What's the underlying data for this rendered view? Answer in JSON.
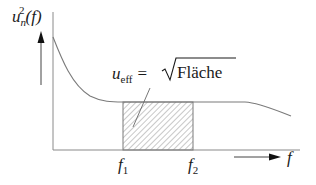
{
  "diagram": {
    "type": "noise-spectral-density",
    "y_axis": {
      "label_base": "u",
      "label_sub": "n",
      "label_sup": "2",
      "label_tail": "(f)"
    },
    "x_axis": {
      "label": "f"
    },
    "band": {
      "lower_label_base": "f",
      "lower_label_sub": "1",
      "upper_label_base": "f",
      "upper_label_sub": "2"
    },
    "annotation": {
      "lhs_base": "u",
      "lhs_sub": "eff",
      "equals": "=",
      "rhs_radicand": "Fläche"
    },
    "colors": {
      "stroke": "#7a7a7a",
      "axis": "#8a8a8a",
      "text": "#1a1a1a",
      "arrow": "#111111",
      "hatch": "#9a9a9a"
    }
  }
}
